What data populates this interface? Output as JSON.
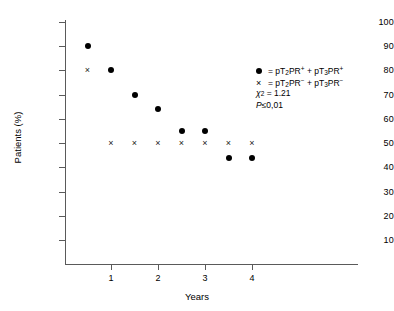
{
  "chart_data": {
    "type": "scatter",
    "title": "",
    "xlabel": "Years",
    "ylabel": "Patients (%)",
    "xlim": [
      0,
      4.75
    ],
    "ylim": [
      0,
      103
    ],
    "xticks": [
      1,
      2,
      3,
      4
    ],
    "yticks": [
      10,
      20,
      30,
      40,
      50,
      60,
      70,
      80,
      90,
      100
    ],
    "grid": false,
    "legend_position": "upper right",
    "series": [
      {
        "name": "pT2PR+ + pT3PR+",
        "marker": "filled-circle",
        "color": "#000000",
        "x": [
          0.5,
          1.0,
          1.5,
          2.0,
          2.5,
          3.0,
          3.5,
          4.0
        ],
        "y": [
          90,
          80,
          70,
          64,
          55,
          55,
          44,
          44
        ]
      },
      {
        "name": "pT2PR- + pT3PR-",
        "marker": "cross",
        "color": "#1a1a1a",
        "x": [
          0.5,
          1.0,
          1.5,
          2.0,
          2.5,
          3.0,
          3.5,
          4.0
        ],
        "y": [
          80,
          50,
          50,
          50,
          50,
          50,
          50,
          50
        ]
      }
    ],
    "annotations": [
      {
        "text": "χ² = 1.21"
      },
      {
        "text": "P ≤ 0,01"
      }
    ]
  },
  "legend": {
    "series_a": {
      "marker_name": "filled-circle-marker",
      "equals": "=",
      "prefix": "pT",
      "sub1": "2",
      "mid": "PR",
      "sup1": "+",
      "plus": "+",
      "prefix2": "pT",
      "sub2": "3",
      "mid2": "PR",
      "sup2": "+"
    },
    "series_b": {
      "marker_glyph": "×",
      "equals": "=",
      "prefix": "pT",
      "sub1": "2",
      "mid": "PR",
      "sup1": "−",
      "plus": "+",
      "prefix2": "pT",
      "sub2": "3",
      "mid2": "PR",
      "sup2": "−"
    },
    "chi_symbol": "χ",
    "chi_exponent": "2",
    "chi_value": "= 1.21",
    "p_symbol": "P",
    "p_value": "≤0,01"
  },
  "axes": {
    "x_title": "Years",
    "y_title": "Patients (%)",
    "x_tick_labels": [
      "1",
      "2",
      "3",
      "4"
    ],
    "y_tick_labels": [
      "10",
      "20",
      "30",
      "40",
      "50",
      "60",
      "70",
      "80",
      "90",
      "100"
    ]
  },
  "colors": {
    "axis": "#5a5a5a",
    "marker": "#000000",
    "background": "#ffffff"
  }
}
